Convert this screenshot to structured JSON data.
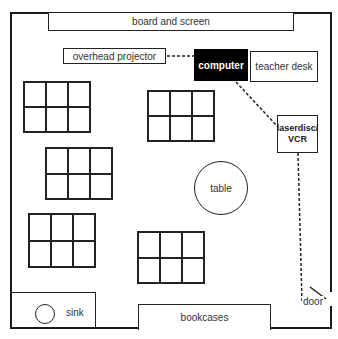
{
  "diagram": {
    "type": "classroom floor plan",
    "room": {
      "board": "board and screen",
      "overhead_projector": "overhead projector",
      "computer": "computer",
      "teacher_desk": "teacher desk",
      "laserdisc_vcr": {
        "line1": "laserdisc/",
        "line2": "VCR"
      },
      "table": "table",
      "sink": "sink",
      "bookcases": "bookcases",
      "door": "door"
    },
    "desk_groups": [
      {
        "id": 1,
        "rows": 2,
        "cols": 3
      },
      {
        "id": 2,
        "rows": 2,
        "cols": 3
      },
      {
        "id": 3,
        "rows": 2,
        "cols": 3
      },
      {
        "id": 4,
        "rows": 2,
        "cols": 3
      },
      {
        "id": 5,
        "rows": 2,
        "cols": 3
      }
    ],
    "connections": [
      {
        "from": "computer",
        "to": "overhead projector",
        "style": "dashed"
      },
      {
        "from": "computer",
        "to": "laserdisc/VCR",
        "style": "dashed"
      },
      {
        "from": "laserdisc/VCR",
        "to": "door",
        "style": "dashed"
      }
    ],
    "colors": {
      "line": "#222222",
      "computer_fill": "#000000",
      "computer_text": "#ffffff",
      "background": "#ffffff"
    }
  }
}
